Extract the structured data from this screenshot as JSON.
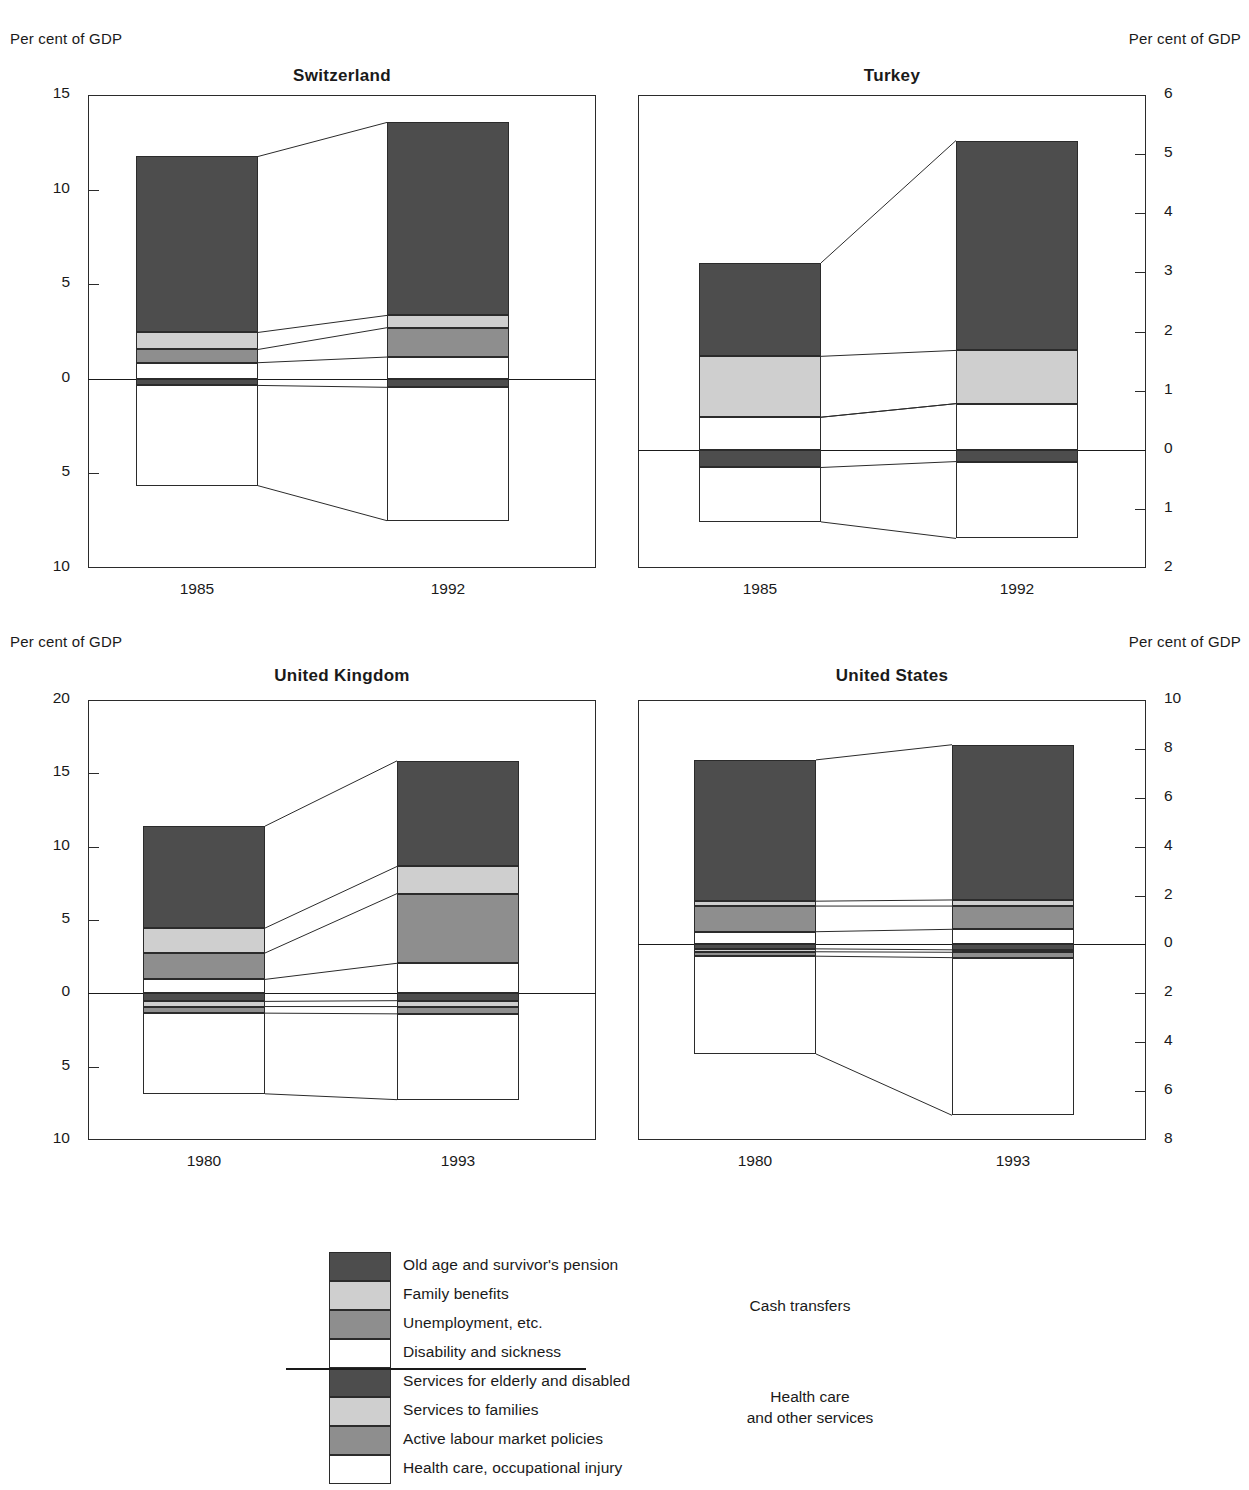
{
  "page": {
    "left_caption": "Per cent of GDP",
    "right_caption": "Per cent of GDP"
  },
  "colors": {
    "pension": "#4d4d4d",
    "family_benefits": "#cfcfcf",
    "unemployment": "#8e8e8e",
    "disability": "#ffffff",
    "services_elderly": "#4d4d4d",
    "services_families": "#cfcfcf",
    "almp": "#8e8e8e",
    "health_care": "#ffffff",
    "outline": "#2b2b2b",
    "axis": "#1a1a1a"
  },
  "legend": {
    "items": [
      {
        "key": "pension",
        "label": "Old age and survivor's pension",
        "color": "#4d4d4d"
      },
      {
        "key": "family_benefits",
        "label": "Family benefits",
        "color": "#cfcfcf"
      },
      {
        "key": "unemployment",
        "label": "Unemployment, etc.",
        "color": "#8e8e8e"
      },
      {
        "key": "disability",
        "label": "Disability and sickness",
        "color": "#ffffff"
      },
      {
        "key": "services_elderly",
        "label": "Services for elderly and disabled",
        "color": "#4d4d4d"
      },
      {
        "key": "services_families",
        "label": "Services to families",
        "color": "#cfcfcf"
      },
      {
        "key": "almp",
        "label": "Active labour market policies",
        "color": "#8e8e8e"
      },
      {
        "key": "health_care",
        "label": "Health care, occupational injury",
        "color": "#ffffff"
      }
    ],
    "group_above": "Cash transfers",
    "group_below_line1": "Health care",
    "group_below_line2": "and other services"
  },
  "chart_data": [
    {
      "type": "bar",
      "title": "Switzerland",
      "subtype": "stacked-diverging",
      "ylabel": "Per cent of GDP",
      "ylim": [
        -10,
        15
      ],
      "yticks": [
        15,
        10,
        5,
        0,
        5,
        10
      ],
      "ytick_values": [
        15,
        10,
        5,
        0,
        -5,
        -10
      ],
      "axis_side": "left",
      "categories": [
        "1985",
        "1992"
      ],
      "series_above": [
        {
          "name": "Disability and sickness",
          "values": [
            0.85,
            1.15
          ]
        },
        {
          "name": "Unemployment, etc.",
          "values": [
            0.7,
            1.55
          ]
        },
        {
          "name": "Family benefits",
          "values": [
            0.9,
            0.65
          ]
        },
        {
          "name": "Old age and survivor's pension",
          "values": [
            9.3,
            10.2
          ]
        }
      ],
      "series_below": [
        {
          "name": "Services for elderly and disabled",
          "values": [
            0.35,
            0.45
          ]
        },
        {
          "name": "Services to families",
          "values": [
            0.0,
            0.0
          ]
        },
        {
          "name": "Active labour market policies",
          "values": [
            0.0,
            0.0
          ]
        },
        {
          "name": "Health care, occupational injury",
          "values": [
            5.3,
            7.05
          ]
        }
      ],
      "total_above": [
        11.75,
        13.55
      ],
      "total_below": [
        5.65,
        7.5
      ]
    },
    {
      "type": "bar",
      "title": "Turkey",
      "subtype": "stacked-diverging",
      "ylabel": "Per cent of GDP",
      "ylim": [
        -2,
        6
      ],
      "yticks": [
        6,
        5,
        4,
        3,
        2,
        1,
        0,
        1,
        2
      ],
      "ytick_values": [
        6,
        5,
        4,
        3,
        2,
        1,
        0,
        -1,
        -2
      ],
      "axis_side": "right",
      "categories": [
        "1985",
        "1992"
      ],
      "series_above": [
        {
          "name": "Disability and sickness",
          "values": [
            0.55,
            0.78
          ]
        },
        {
          "name": "Unemployment, etc.",
          "values": [
            0.0,
            0.0
          ]
        },
        {
          "name": "Family benefits",
          "values": [
            1.03,
            0.9
          ]
        },
        {
          "name": "Old age and survivor's pension",
          "values": [
            1.58,
            3.55
          ]
        }
      ],
      "series_below": [
        {
          "name": "Services for elderly and disabled",
          "values": [
            0.3,
            0.2
          ]
        },
        {
          "name": "Services to families",
          "values": [
            0.0,
            0.0
          ]
        },
        {
          "name": "Active labour market policies",
          "values": [
            0.0,
            0.0
          ]
        },
        {
          "name": "Health care, occupational injury",
          "values": [
            0.92,
            1.3
          ]
        }
      ],
      "total_above": [
        3.16,
        5.23
      ],
      "total_below": [
        1.22,
        1.5
      ]
    },
    {
      "type": "bar",
      "title": "United Kingdom",
      "subtype": "stacked-diverging",
      "ylabel": "Per cent of GDP",
      "ylim": [
        -10,
        20
      ],
      "yticks": [
        20,
        15,
        10,
        5,
        0,
        5,
        10
      ],
      "ytick_values": [
        20,
        15,
        10,
        5,
        0,
        -5,
        -10
      ],
      "axis_side": "left",
      "categories": [
        "1980",
        "1993"
      ],
      "series_above": [
        {
          "name": "Disability and sickness",
          "values": [
            0.95,
            2.05
          ]
        },
        {
          "name": "Unemployment, etc.",
          "values": [
            1.8,
            4.75
          ]
        },
        {
          "name": "Family benefits",
          "values": [
            1.7,
            1.85
          ]
        },
        {
          "name": "Old age and survivor's pension",
          "values": [
            6.95,
            7.2
          ]
        }
      ],
      "series_below": [
        {
          "name": "Services for elderly and disabled",
          "values": [
            0.55,
            0.5
          ]
        },
        {
          "name": "Services to families",
          "values": [
            0.35,
            0.4
          ]
        },
        {
          "name": "Active labour market policies",
          "values": [
            0.45,
            0.5
          ]
        },
        {
          "name": "Health care, occupational injury",
          "values": [
            5.5,
            5.85
          ]
        }
      ],
      "total_above": [
        11.4,
        15.85
      ],
      "total_below": [
        6.85,
        7.25
      ]
    },
    {
      "type": "bar",
      "title": "United States",
      "subtype": "stacked-diverging",
      "ylabel": "Per cent of GDP",
      "ylim": [
        -8,
        10
      ],
      "yticks": [
        10,
        8,
        6,
        4,
        2,
        0,
        2,
        4,
        6,
        8
      ],
      "ytick_values": [
        10,
        8,
        6,
        4,
        2,
        0,
        -2,
        -4,
        -6,
        -8
      ],
      "axis_side": "right",
      "categories": [
        "1980",
        "1993"
      ],
      "series_above": [
        {
          "name": "Disability and sickness",
          "values": [
            0.52,
            0.62
          ]
        },
        {
          "name": "Unemployment, etc.",
          "values": [
            1.05,
            0.95
          ]
        },
        {
          "name": "Family benefits",
          "values": [
            0.2,
            0.25
          ]
        },
        {
          "name": "Old age and survivor's pension",
          "values": [
            5.78,
            6.35
          ]
        }
      ],
      "series_below": [
        {
          "name": "Services for elderly and disabled",
          "values": [
            0.18,
            0.22
          ]
        },
        {
          "name": "Services to families",
          "values": [
            0.12,
            0.1
          ]
        },
        {
          "name": "Active labour market policies",
          "values": [
            0.18,
            0.22
          ]
        },
        {
          "name": "Health care, occupational injury",
          "values": [
            4.0,
            6.45
          ]
        }
      ],
      "total_above": [
        7.55,
        8.17
      ],
      "total_below": [
        4.48,
        6.99
      ]
    }
  ]
}
